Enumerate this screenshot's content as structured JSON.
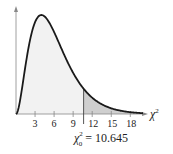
{
  "chart_data": {
    "type": "area",
    "title": "",
    "distribution": "chi-square",
    "degrees_of_freedom": 6,
    "xlabel": "χ²",
    "ylabel": "",
    "x_ticks": [
      3,
      6,
      9,
      12,
      15,
      18
    ],
    "x_tick_labels": [
      "3",
      "6",
      "9",
      "12",
      "15",
      "18"
    ],
    "xlim": [
      0,
      20
    ],
    "grid": false,
    "legend": "none",
    "critical_value": 10.645,
    "critical_label_symbol": "χ",
    "critical_label_sup": "2",
    "critical_label_sub": "0",
    "critical_label_text": " = 10.645",
    "shaded_region": "right tail, x ≥ 10.645",
    "colors": {
      "curve": "#1a1a1a",
      "body_fill": "#f2f2f2",
      "tail_fill": "#cfcfcf",
      "axis": "#777777"
    }
  }
}
